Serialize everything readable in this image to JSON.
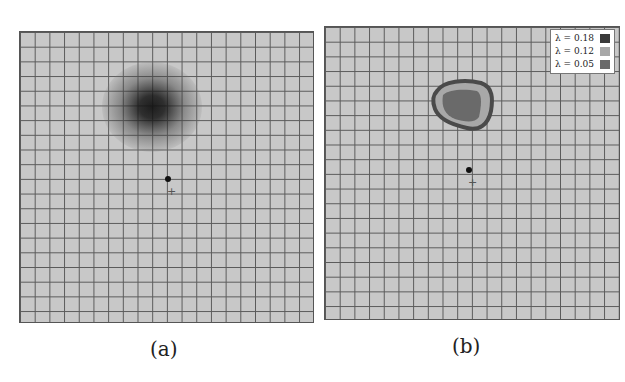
{
  "panels": [
    {
      "id": "a",
      "caption": "(a)",
      "type": "heatmap-grid",
      "hotspot": {
        "cx": 132,
        "cy": 78,
        "color": "#111111"
      },
      "marker_dot": {
        "x": 148,
        "y": 147
      },
      "marker_plus": {
        "x": 151,
        "y": 160,
        "symbol": "+"
      }
    },
    {
      "id": "b",
      "caption": "(b)",
      "type": "contour-grid",
      "legend": [
        {
          "label": "λ = 0.18",
          "color": "#3a3a3a"
        },
        {
          "label": "λ = 0.12",
          "color": "#a8a8a8"
        },
        {
          "label": "λ = 0.05",
          "color": "#6a6a6a"
        }
      ],
      "marker_dot": {
        "x": 143,
        "y": 143
      },
      "marker_plus": {
        "x": 146,
        "y": 155,
        "symbol": "+"
      }
    }
  ],
  "colors": {
    "grid_bg": "#c8c8c8",
    "grid_line": "#5a5a5a"
  }
}
